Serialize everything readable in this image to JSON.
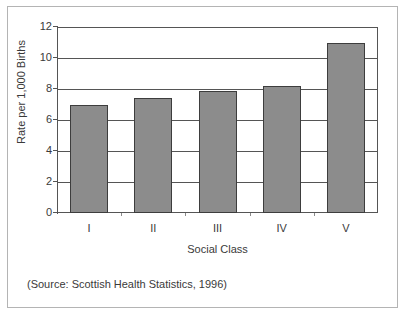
{
  "chart_data": {
    "type": "bar",
    "title": "",
    "categories": [
      "I",
      "II",
      "III",
      "IV",
      "V"
    ],
    "values": [
      7.0,
      7.4,
      7.9,
      8.2,
      11.0
    ],
    "xlabel": "Social Class",
    "ylabel": "Rate per 1,000 Births",
    "ylim": [
      0,
      12
    ],
    "yticks": [
      0,
      2,
      4,
      6,
      8,
      10,
      12
    ],
    "ytick_labels": [
      "0",
      "2",
      "4",
      "6",
      "8",
      "10",
      "12"
    ],
    "grid": true,
    "grid_axis": "y",
    "legend": false,
    "bar_color": "#8c8c8c",
    "bar_edge_color": "#3d3d3d",
    "axis_color": "#555555"
  },
  "source": {
    "note": "(Source: Scottish Health Statistics, 1996)"
  }
}
